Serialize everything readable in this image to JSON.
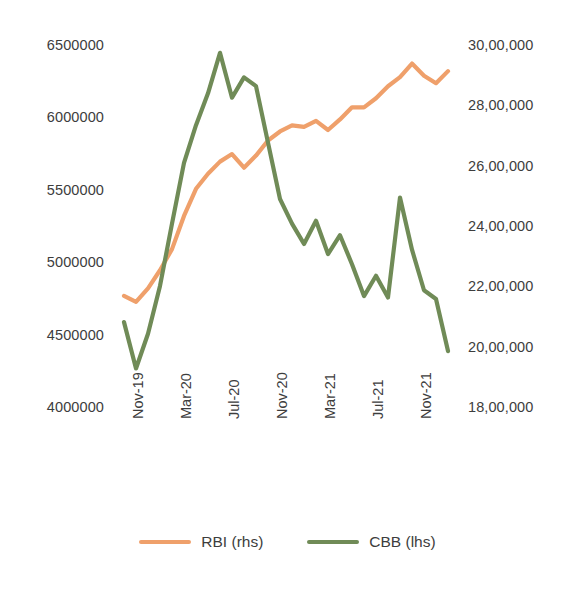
{
  "chart_data": {
    "type": "line",
    "title": "",
    "xlabel": "",
    "ylabel": "",
    "grid": false,
    "legend_position": "bottom-center",
    "x_tick_labels": [
      "Nov-19",
      "Mar-20",
      "Jul-20",
      "Nov-20",
      "Mar-21",
      "Jul-21",
      "Nov-21"
    ],
    "x_tick_months": [
      "2019-11",
      "2020-03",
      "2020-07",
      "2020-11",
      "2021-03",
      "2021-07",
      "2021-11"
    ],
    "x_range": [
      "2019-11",
      "2022-02"
    ],
    "axes": [
      {
        "id": "left",
        "side": "left",
        "series": "CBB (lhs)",
        "ticks": [
          "4000000",
          "4500000",
          "5000000",
          "5500000",
          "6000000",
          "6500000"
        ],
        "tick_values": [
          4000000,
          4500000,
          5000000,
          5500000,
          6000000,
          6500000
        ],
        "ylim": [
          4000000,
          6500000
        ]
      },
      {
        "id": "right",
        "side": "right",
        "series": "RBI (rhs)",
        "ticks": [
          "18,00,000",
          "20,00,000",
          "22,00,000",
          "24,00,000",
          "26,00,000",
          "28,00,000",
          "30,00,000"
        ],
        "tick_values": [
          1800000,
          2000000,
          2200000,
          2400000,
          2600000,
          2800000,
          3000000
        ],
        "ylim": [
          1800000,
          3000000
        ]
      }
    ],
    "x": [
      "2019-11",
      "2019-12",
      "2020-01",
      "2020-02",
      "2020-03",
      "2020-04",
      "2020-05",
      "2020-06",
      "2020-07",
      "2020-08",
      "2020-09",
      "2020-10",
      "2020-11",
      "2020-12",
      "2021-01",
      "2021-02",
      "2021-03",
      "2021-04",
      "2021-05",
      "2021-06",
      "2021-07",
      "2021-08",
      "2021-09",
      "2021-10",
      "2021-11",
      "2021-12",
      "2022-01",
      "2022-02"
    ],
    "series": [
      {
        "name": "RBI (rhs)",
        "axis": "right",
        "color": "#EFA06B",
        "values": [
          2175000,
          2155000,
          2200000,
          2260000,
          2330000,
          2440000,
          2530000,
          2580000,
          2620000,
          2645000,
          2600000,
          2640000,
          2690000,
          2720000,
          2740000,
          2735000,
          2755000,
          2725000,
          2760000,
          2800000,
          2800000,
          2830000,
          2870000,
          2900000,
          2945000,
          2905000,
          2880000,
          2920000
        ]
      },
      {
        "name": "CBB (lhs)",
        "axis": "left",
        "color": "#708B57",
        "values": [
          4600000,
          4280000,
          4520000,
          4850000,
          5280000,
          5700000,
          5960000,
          6180000,
          6460000,
          6150000,
          6290000,
          6230000,
          5840000,
          5450000,
          5280000,
          5140000,
          5300000,
          5070000,
          5200000,
          5000000,
          4780000,
          4920000,
          4770000,
          5460000,
          5100000,
          4820000,
          4760000,
          4400000
        ]
      }
    ]
  },
  "legend": {
    "items": [
      {
        "label": "RBI (rhs)",
        "color": "#EFA06B"
      },
      {
        "label": "CBB (lhs)",
        "color": "#708B57"
      }
    ]
  }
}
